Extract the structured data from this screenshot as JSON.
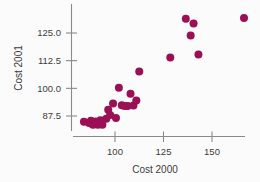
{
  "chart_data": {
    "type": "scatter",
    "title": "",
    "xlabel": "Cost 2000",
    "ylabel": "Cost 2001",
    "xlim": [
      78,
      174
    ],
    "ylim": [
      82.5,
      135
    ],
    "xticks": [
      100,
      125,
      150
    ],
    "xtick_labels": [
      "100",
      "125",
      "150"
    ],
    "yticks": [
      87.5,
      100.0,
      112.5,
      125.0
    ],
    "ytick_labels": [
      "87.5",
      "100.0",
      "112.5",
      "125.0"
    ],
    "grid": false,
    "legend": null,
    "marker_color": "#9B1055",
    "marker_size": 4.0,
    "axis_color": "#8A8A8A",
    "background_color": "#FCFBFB",
    "points": [
      {
        "x": 84.0,
        "y": 84.9
      },
      {
        "x": 86.6,
        "y": 84.3
      },
      {
        "x": 87.6,
        "y": 85.4
      },
      {
        "x": 88.1,
        "y": 84.2
      },
      {
        "x": 88.6,
        "y": 83.6
      },
      {
        "x": 89.1,
        "y": 84.8
      },
      {
        "x": 89.6,
        "y": 83.8
      },
      {
        "x": 90.1,
        "y": 85.0
      },
      {
        "x": 90.6,
        "y": 84.0
      },
      {
        "x": 91.2,
        "y": 83.5
      },
      {
        "x": 92.5,
        "y": 85.6
      },
      {
        "x": 93.5,
        "y": 83.6
      },
      {
        "x": 95.5,
        "y": 86.3
      },
      {
        "x": 96.5,
        "y": 90.3
      },
      {
        "x": 97.5,
        "y": 88.0
      },
      {
        "x": 99.0,
        "y": 93.2
      },
      {
        "x": 100.5,
        "y": 86.6
      },
      {
        "x": 102.0,
        "y": 100.3
      },
      {
        "x": 103.5,
        "y": 92.4
      },
      {
        "x": 105.0,
        "y": 92.0
      },
      {
        "x": 106.5,
        "y": 92.0
      },
      {
        "x": 108.0,
        "y": 97.6
      },
      {
        "x": 109.5,
        "y": 92.3
      },
      {
        "x": 111.0,
        "y": 94.5
      },
      {
        "x": 112.5,
        "y": 107.6
      },
      {
        "x": 128.5,
        "y": 113.9
      },
      {
        "x": 136.5,
        "y": 131.4
      },
      {
        "x": 139.0,
        "y": 123.9
      },
      {
        "x": 140.5,
        "y": 129.3
      },
      {
        "x": 143.0,
        "y": 115.3
      },
      {
        "x": 166.5,
        "y": 131.8
      }
    ]
  }
}
